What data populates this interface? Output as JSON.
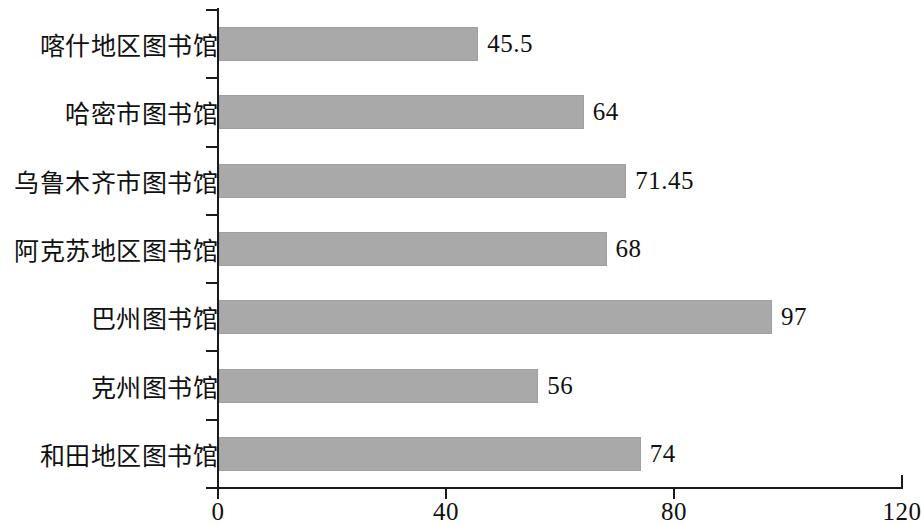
{
  "chart_data": {
    "type": "bar",
    "orientation": "horizontal",
    "title": "",
    "subtitle": "",
    "xlabel": "",
    "ylabel": "",
    "categories": [
      "喀什地区图书馆",
      "哈密市图书馆",
      "乌鲁木齐市图书馆",
      "阿克苏地区图书馆",
      "巴州图书馆",
      "克州图书馆",
      "和田地区图书馆"
    ],
    "values": [
      45.5,
      64,
      71.45,
      68,
      97,
      56,
      74
    ],
    "value_labels": [
      "45.5",
      "64",
      "71.45",
      "68",
      "97",
      "56",
      "74"
    ],
    "xlim": [
      0,
      120
    ],
    "xticks": [
      0,
      40,
      80,
      120
    ],
    "xtick_labels": [
      "0",
      "40",
      "80",
      "120"
    ],
    "grid": false,
    "legend": null,
    "bar_color": "#a9a9a9",
    "axis_color": "#1a1a1a",
    "background": "#ffffff"
  }
}
